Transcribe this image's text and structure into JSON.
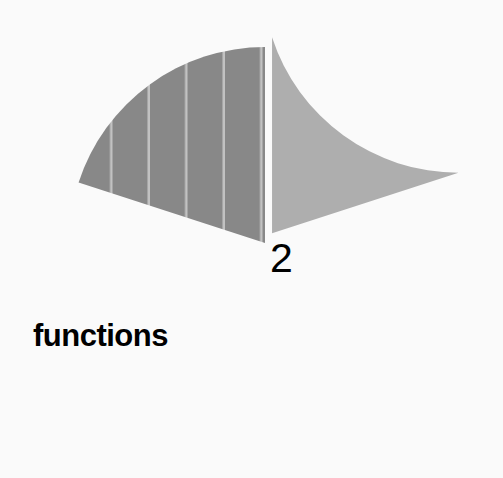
{
  "chart_data": {
    "type": "pie",
    "title": "",
    "subtitle": "",
    "xlabel": "",
    "ylabel": "",
    "grid": false,
    "legend_position": "none",
    "background_color": "#fafafa",
    "labels": [
      "functions",
      "2"
    ],
    "values": [
      80,
      20
    ],
    "slices": [
      {
        "label": "functions",
        "value": 80,
        "percent": 80,
        "color": "#888888",
        "hatch": "vertical-stripes",
        "hatch_color": "#c4c4c4",
        "exploded": false,
        "label_color": "#000000",
        "label_bold": true,
        "start_angle_deg": 90,
        "end_angle_deg": 378
      },
      {
        "label": "2",
        "value": 20,
        "percent": 20,
        "color": "#aeaeae",
        "hatch": "none",
        "exploded": true,
        "label_color": "#000000",
        "label_bold": false,
        "start_angle_deg": 18,
        "end_angle_deg": 90
      }
    ],
    "annotations": [
      {
        "text": "functions",
        "x": 33,
        "y": 320
      },
      {
        "text": "2",
        "x": 270,
        "y": 238
      }
    ],
    "geometry": {
      "center_x": 265,
      "center_y": 243,
      "radius": 196,
      "explode_offset_px": 12,
      "stripe_spacing_px": 37.5,
      "stripe_width_px": 3
    }
  },
  "labels": {
    "functions": "functions",
    "two": "2"
  },
  "colors": {
    "background": "#fafafa",
    "slice_primary": "#888888",
    "slice_secondary": "#aeaeae",
    "hatch": "#c4c4c4",
    "text": "#000000"
  }
}
